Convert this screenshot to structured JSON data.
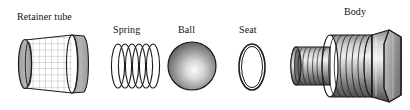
{
  "diagram": {
    "type": "exploded-assembly-view",
    "background_color": "#ffffff",
    "line_color": "#1a1a1a",
    "label_color": "#111111",
    "parts": [
      {
        "id": "retainer-tube",
        "label": "Retainer tube",
        "shape": "mesh-cylinder",
        "label_x": 17,
        "label_y": 11,
        "fill": "#a8a8a8",
        "mesh_fill": "#ffffff",
        "mesh_line": "#9a9a9a"
      },
      {
        "id": "spring",
        "label": "Spring",
        "shape": "coil-ellipses",
        "label_x": 113,
        "label_y": 24,
        "coils": 6,
        "fill": "#ffffff"
      },
      {
        "id": "ball",
        "label": "Ball",
        "shape": "sphere",
        "label_x": 178,
        "label_y": 24,
        "highlight": "#f2f2f2",
        "shade": "#5a5a5a"
      },
      {
        "id": "seat",
        "label": "Seat",
        "shape": "o-ring-ellipse",
        "label_x": 239,
        "label_y": 24,
        "fill": "#ffffff"
      },
      {
        "id": "body",
        "label": "Body",
        "shape": "threaded-hex-fitting",
        "label_x": 344,
        "label_y": 6,
        "fill_light": "#dcdcdc",
        "fill_mid": "#9e9e9e",
        "fill_dark": "#4a4a4a"
      }
    ]
  }
}
